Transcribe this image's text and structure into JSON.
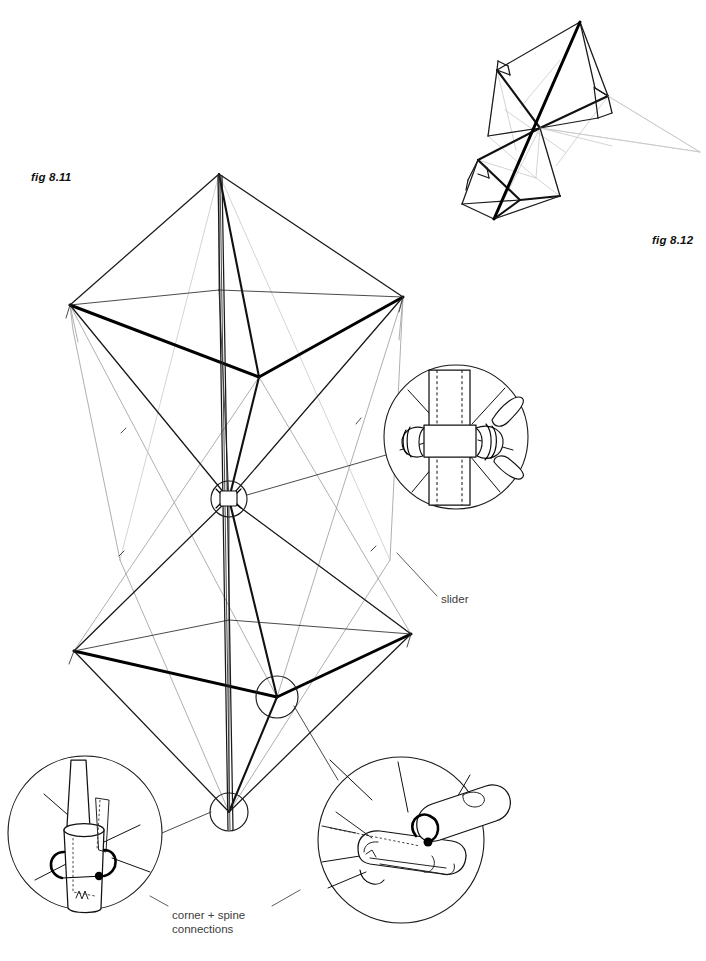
{
  "page": {
    "width": 706,
    "height": 961,
    "background": "#ffffff",
    "ink": "#111111",
    "annotation_color": "#3d3d3d"
  },
  "figures": [
    {
      "id": "fig-8-11",
      "label": "fig 8.11",
      "caption": "fig 8.11",
      "description": "Front elevation of a two-cell diamond/octahedral kite frame on a single vertical spine"
    },
    {
      "id": "fig-8-12",
      "label": "fig 8.12",
      "caption": "fig 8.12",
      "description": "Oblique three-quarter view of the same two-cell kite frame"
    }
  ],
  "labels": {
    "fig_811": "fig 8.11",
    "fig_812": "fig 8.12",
    "slider": "slider",
    "corner_spine": "corner + spine\nconnections",
    "corner_spine_line1": "corner + spine",
    "corner_spine_line2": "connections"
  },
  "callouts": [
    {
      "name": "slider-detail",
      "position": "right-middle",
      "center": [
        456,
        437
      ],
      "radius": 72,
      "depicts": "spine tube with sliding collar and lark's-head knotted cord"
    },
    {
      "name": "spine-socket-detail",
      "position": "bottom-left",
      "center": [
        85,
        833
      ],
      "radius": 77,
      "depicts": "spar end inserted into ferrule sleeve with rubber retaining band"
    },
    {
      "name": "corner-connector-detail",
      "position": "bottom-right",
      "center": [
        401,
        840
      ],
      "radius": 83,
      "depicts": "angled corner connector sleeve with looped cord"
    }
  ],
  "nodes": [
    {
      "name": "centre-slider-node",
      "center": [
        229,
        499
      ],
      "radius": 18
    },
    {
      "name": "lower-corner-node",
      "center": [
        277,
        697
      ],
      "radius": 21
    },
    {
      "name": "keel-node",
      "center": [
        229,
        812
      ],
      "radius": 19
    }
  ],
  "geometry": {
    "fig811": {
      "apex": [
        219,
        174
      ],
      "upper_left": [
        70,
        305
      ],
      "upper_right": [
        403,
        297
      ],
      "upper_front": [
        259,
        377
      ],
      "upper_back": [
        219,
        290
      ],
      "centre": [
        229,
        499
      ],
      "lower_left": [
        74,
        651
      ],
      "lower_right": [
        411,
        634
      ],
      "lower_front": [
        277,
        697
      ],
      "lower_back": [
        229,
        620
      ],
      "tail": [
        229,
        812
      ],
      "spine_top": [
        219,
        174
      ],
      "spine_bottom": [
        231,
        830
      ]
    },
    "fig812": {
      "top": [
        580,
        22
      ],
      "bottom": [
        494,
        219
      ],
      "mid": [
        541,
        127
      ]
    }
  },
  "annotations": {
    "slider_leader_from": [
      429,
      571
    ],
    "slider_leader_to": [
      397,
      553
    ],
    "corner_leader_left_from": [
      205,
      905
    ],
    "corner_leader_right_from": [
      262,
      905
    ]
  }
}
